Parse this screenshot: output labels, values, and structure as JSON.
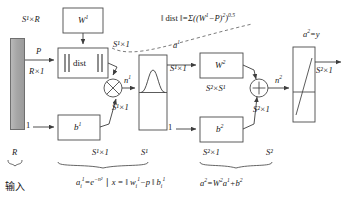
{
  "diagram": {
    "input_bar": {
      "name": "input-vector-bar"
    },
    "blocks": [
      {
        "id": "w1",
        "label": "W",
        "sup": "1"
      },
      {
        "id": "dist",
        "label": "dist"
      },
      {
        "id": "b1",
        "label": "b",
        "sup": "1"
      },
      {
        "id": "w2",
        "label": "W",
        "sup": "2"
      },
      {
        "id": "b2",
        "label": "b",
        "sup": "2"
      }
    ],
    "operators": {
      "product": "⊗",
      "sum": "⊕"
    },
    "signal_labels": {
      "p": "P",
      "a1": "a",
      "a1_sup": "1",
      "n1": "n",
      "n1_sup": "1",
      "n2": "n",
      "n2_sup": "2",
      "a2_out": "a",
      "a2_out_sup": "2",
      "a2_out_eq": "=y",
      "one_left": "1",
      "one_mid": "1"
    },
    "dimension_labels": {
      "s1xR": "S¹×R",
      "Rx1": "R×1",
      "s1x1_a": "S¹×1",
      "s1x1_b": "S¹×1",
      "s1x1_c": "S¹×1",
      "s1x1_d": "S¹×1",
      "s2xs1": "S²×S¹",
      "s2x1_a": "S²×1",
      "s2x1_b": "S²×1",
      "s2x1_c": "S²×1"
    },
    "brace_labels": {
      "R": "R",
      "S1_dims": "S¹×1",
      "S1": "S¹",
      "S2": "S²"
    },
    "captions": {
      "input_cjk": "输入",
      "layer1_formula_html": "a<sub>i</sub><sup>1</sup>=e<sup>−n²</sup>",
      "layer1_formula_tail_html": "x = ‖ w<sub>i</sub><sup>1</sup>−p ‖  b<sub>i</sub><sup>1</sup>",
      "layer2_formula_html": "a<sup>2</sup>=W<sup>2</sup>a<sup>1</sup>+b<sup>2</sup>",
      "dist_formula_lead": "‖ dist ‖",
      "dist_formula_body_html": "=Σ((W<sup>1</sup>−P)<sup>2</sup>)<sup>0.5</sup>"
    },
    "colors": {
      "stroke": "#4a4a4a",
      "bar_fill": "#a6a6a6",
      "text": "#1a1a1a",
      "background": "#ffffff"
    }
  }
}
